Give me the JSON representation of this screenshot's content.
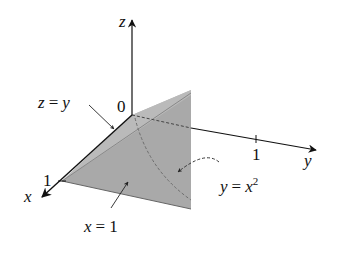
{
  "diagram": {
    "type": "3d-region-sketch",
    "axes": {
      "x": {
        "label": "x",
        "tick": "1"
      },
      "y": {
        "label": "y",
        "tick": "1"
      },
      "z": {
        "label": "z"
      },
      "origin": "0"
    },
    "annotations": [
      {
        "id": "plane-z-eq-y",
        "lhs": "z",
        "eq": "=",
        "rhs": "y"
      },
      {
        "id": "plane-x-eq-1",
        "lhs": "x",
        "eq": "=",
        "rhs": "1"
      },
      {
        "id": "surface-y-eq-x2",
        "lhs": "y",
        "eq": "=",
        "rhs": "x",
        "sup": "2"
      }
    ],
    "colors": {
      "region_fill": "#a9a9a9",
      "top_face_fill": "#c2c2c2",
      "axis": "#111111",
      "curve": "#555555"
    }
  }
}
